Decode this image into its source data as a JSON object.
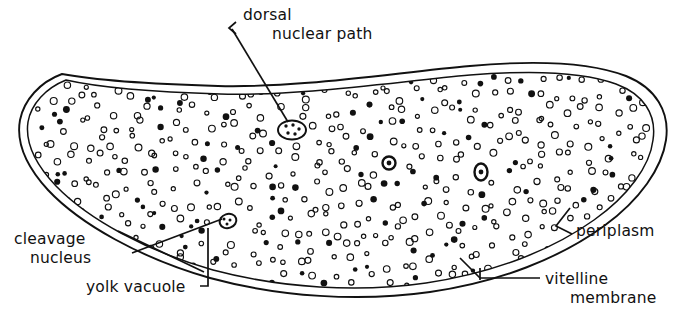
{
  "figure": {
    "background_color": "#ffffff",
    "ink_color": "#111111"
  },
  "labels": {
    "dorsal_nuclear_path": {
      "line1": "dorsal",
      "line2": "nuclear path"
    },
    "cleavage_nucleus": {
      "line1": "cleavage",
      "line2": "nucleus"
    },
    "yolk_vacuole": {
      "line1": "yolk vacuole"
    },
    "periplasm": {
      "line1": "periplasm"
    },
    "vitelline_membrane": {
      "line1": "vitelline",
      "line2": "membrane"
    }
  },
  "structures": {
    "egg_outline": "elongate crescent-shaped egg",
    "vitelline_membrane": "outer thin boundary line",
    "periplasm": "narrow clear zone between vitelline membrane and yolk mass",
    "yolk_granules": "dense stippled circular granules filling interior",
    "nuclei": [
      {
        "name": "dorsal-nucleus-oval",
        "cx": 292,
        "cy": 130,
        "rx": 13,
        "ry": 9,
        "style": "oval-with-dots"
      },
      {
        "name": "cleavage-nucleus-center",
        "cx": 389,
        "cy": 163,
        "rx": 6,
        "ry": 6,
        "style": "ring"
      },
      {
        "name": "cleavage-nucleus-right",
        "cx": 481,
        "cy": 172,
        "rx": 6.5,
        "ry": 8,
        "style": "ring"
      },
      {
        "name": "cleavage-nucleus-lower-left",
        "cx": 228,
        "cy": 221,
        "rx": 8,
        "ry": 7,
        "style": "ring"
      }
    ]
  }
}
